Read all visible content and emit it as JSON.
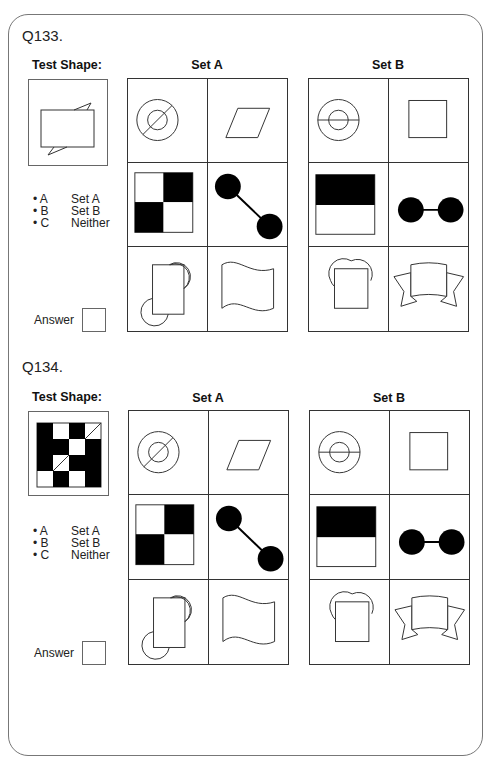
{
  "questions": [
    {
      "number": "Q133.",
      "test_shape_label": "Test Shape:",
      "test_shape": "rectangle-with-flag-tips",
      "set_a": {
        "label": "Set A",
        "cells": [
          "circle-in-circle-diagonal-line",
          "parallelogram",
          "checkerboard-2x2",
          "dumbbell-diagonal",
          "square-with-two-circles-diagonal",
          "wavy-flag"
        ]
      },
      "set_b": {
        "label": "Set B",
        "cells": [
          "circle-in-circle-horizontal-line",
          "square",
          "half-filled-rectangle",
          "dumbbell-horizontal",
          "square-with-two-circles-top",
          "banner-ribbon"
        ]
      },
      "options": [
        {
          "key": "• A",
          "value": "Set A"
        },
        {
          "key": "• B",
          "value": "Set B"
        },
        {
          "key": "• C",
          "value": "Neither"
        }
      ],
      "answer_label": "Answer",
      "answer_value": ""
    },
    {
      "number": "Q134.",
      "test_shape_label": "Test Shape:",
      "test_shape": "checker-grid-4x4",
      "test_grid": [
        [
          "B",
          "W",
          "B",
          "D"
        ],
        [
          "B",
          "B",
          "W",
          "B"
        ],
        [
          "B",
          "D",
          "B",
          "B"
        ],
        [
          "W",
          "B",
          "W",
          "B"
        ]
      ],
      "set_a": {
        "label": "Set A",
        "cells": [
          "circle-in-circle-diagonal-line",
          "parallelogram",
          "checkerboard-2x2",
          "dumbbell-diagonal",
          "square-with-two-circles-diagonal",
          "wavy-flag"
        ]
      },
      "set_b": {
        "label": "Set B",
        "cells": [
          "circle-in-circle-horizontal-line",
          "square",
          "half-filled-rectangle",
          "dumbbell-horizontal",
          "square-with-two-circles-top",
          "banner-ribbon"
        ]
      },
      "options": [
        {
          "key": "• A",
          "value": "Set A"
        },
        {
          "key": "• B",
          "value": "Set B"
        },
        {
          "key": "• C",
          "value": "Neither"
        }
      ],
      "answer_label": "Answer",
      "answer_value": ""
    }
  ],
  "colors": {
    "ink": "#222222",
    "fill": "#000000",
    "frame": "#777777"
  }
}
